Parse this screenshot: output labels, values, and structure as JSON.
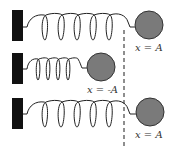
{
  "diagram": {
    "colors": {
      "wall": "#111111",
      "mass": "#7a7a7a",
      "spring": "#222222",
      "dashed": "#444444"
    },
    "rows": [
      {
        "state": "stretched",
        "label": "x = A"
      },
      {
        "state": "compressed",
        "label": "x = -A"
      },
      {
        "state": "stretched",
        "label": "x = A"
      }
    ]
  }
}
